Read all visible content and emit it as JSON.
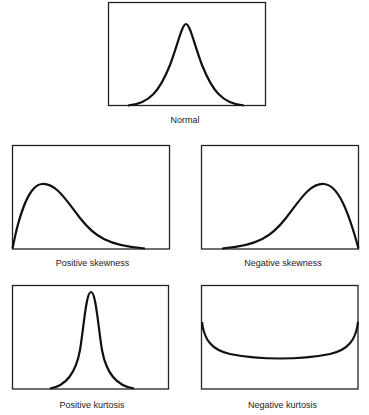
{
  "figure": {
    "panels": [
      {
        "id": "normal",
        "label": "Normal",
        "shape": "symmetric bell curve"
      },
      {
        "id": "positive-skewness",
        "label": "Positive skewness",
        "shape": "peak left, long right tail"
      },
      {
        "id": "negative-skewness",
        "label": "Negative skewness",
        "shape": "peak right, long left tail"
      },
      {
        "id": "positive-kurtosis",
        "label": "Positive kurtosis",
        "shape": "tall narrow peak"
      },
      {
        "id": "negative-kurtosis",
        "label": "Negative kurtosis",
        "shape": "flat U-shaped curve"
      }
    ]
  },
  "style": {
    "stroke": "#111111",
    "background": "#ffffff"
  }
}
